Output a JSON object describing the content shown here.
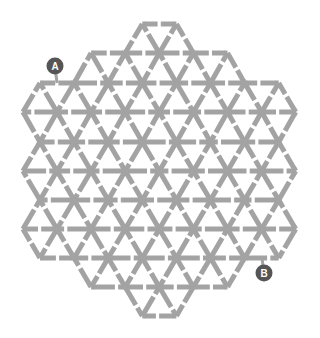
{
  "puzzle": {
    "type": "triangular-lattice-maze",
    "line_color": "#a3a3a3",
    "background": "#ffffff",
    "stroke_width": 5,
    "side": 34.1,
    "origin_x_even": 40,
    "origin_x_odd": 57,
    "rows": [
      {
        "y": 24,
        "kmin": 3,
        "kmax": 4
      },
      {
        "y": 53,
        "kmin": 1,
        "kmax": 5
      },
      {
        "y": 83,
        "kmin": 0,
        "kmax": 7
      },
      {
        "y": 112,
        "kmin": -1,
        "kmax": 7
      },
      {
        "y": 142,
        "kmin": 0,
        "kmax": 7
      },
      {
        "y": 171,
        "kmin": -1,
        "kmax": 7
      },
      {
        "y": 200,
        "kmin": 0,
        "kmax": 7
      },
      {
        "y": 229,
        "kmin": -1,
        "kmax": 7
      },
      {
        "y": 258,
        "kmin": 0,
        "kmax": 7
      },
      {
        "y": 287,
        "kmin": 1,
        "kmax": 5
      },
      {
        "y": 316,
        "kmin": 3,
        "kmax": 4
      }
    ]
  },
  "markers": [
    {
      "label": "A",
      "cx": 55,
      "cy": 66,
      "r": 8.5,
      "color": "#555555",
      "text_color": "#ffffff",
      "anchor_x": 57,
      "anchor_y": 83
    },
    {
      "label": "B",
      "cx": 264,
      "cy": 273,
      "r": 8.5,
      "color": "#555555",
      "text_color": "#ffffff",
      "anchor_x": 262,
      "anchor_y": 258
    }
  ]
}
